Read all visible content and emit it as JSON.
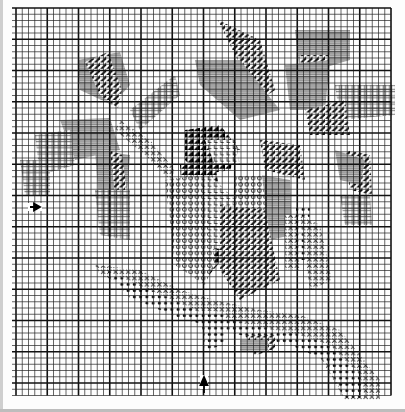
{
  "title": "Cross-stitch chart: bird on branch",
  "grid": {
    "left": 16,
    "top": 8,
    "cell": 6.25,
    "cols": 60,
    "rows": 62,
    "bold_every": 5,
    "line_color": "#222222",
    "bold_color": "#111111"
  },
  "center_markers": [
    {
      "name": "row-center-arrow",
      "direction": "right",
      "x": 30,
      "y": 207
    },
    {
      "name": "col-center-arrow",
      "direction": "up",
      "x": 204,
      "y": 385
    }
  ],
  "symbols": [
    {
      "key": "dark-diagonal",
      "meaning": "dark stitch (black diagonal)"
    },
    {
      "key": "grey-hatch",
      "meaning": "mid grey stitch"
    },
    {
      "key": "cross-hatch",
      "meaning": "light green cross-hatch"
    },
    {
      "key": "x-mark",
      "meaning": "branch light (x)"
    },
    {
      "key": "dot-circle",
      "meaning": "branch dark (dot)"
    },
    {
      "key": "L-mark",
      "meaning": "bird breast (L)"
    },
    {
      "key": "o-mark",
      "meaning": "bird belly (o)"
    },
    {
      "key": "solid-black",
      "meaning": "bird head/wing black"
    }
  ],
  "regions": [
    {
      "sym": "grey-hatch",
      "pts": "78,60 120,52 130,85 112,105 80,90"
    },
    {
      "sym": "dark-diagonal",
      "pts": "85,62 108,52 122,90 118,108 100,95"
    },
    {
      "sym": "cross-hatch",
      "pts": "130,110 175,75 180,95 140,130"
    },
    {
      "sym": "grey-hatch",
      "pts": "60,120 110,118 120,150 75,160"
    },
    {
      "sym": "cross-hatch",
      "pts": "35,135 70,130 75,165 40,175"
    },
    {
      "sym": "cross-hatch",
      "pts": "20,160 50,160 50,195 25,195"
    },
    {
      "sym": "grey-hatch",
      "pts": "95,150 130,155 125,225 100,215"
    },
    {
      "sym": "dark-diagonal",
      "pts": "110,150 122,155 128,200 115,195"
    },
    {
      "sym": "cross-hatch",
      "pts": "95,190 130,190 130,240 100,235"
    },
    {
      "sym": "dark-diagonal",
      "pts": "218,20 260,40 275,90 260,100 235,55"
    },
    {
      "sym": "grey-hatch",
      "pts": "195,60 240,60 280,110 240,120 200,85"
    },
    {
      "sym": "grey-hatch",
      "pts": "295,30 350,30 350,60 300,75"
    },
    {
      "sym": "dark-diagonal",
      "pts": "300,55 330,55 315,105 300,105"
    },
    {
      "sym": "grey-hatch",
      "pts": "285,65 330,60 325,110 290,110"
    },
    {
      "sym": "cross-hatch",
      "pts": "335,85 395,85 395,115 340,120"
    },
    {
      "sym": "dark-diagonal",
      "pts": "305,110 345,100 350,135 310,135"
    },
    {
      "sym": "dark-diagonal",
      "pts": "260,140 300,145 305,180 265,170"
    },
    {
      "sym": "dark-diagonal",
      "pts": "345,150 370,155 372,195 350,190"
    },
    {
      "sym": "grey-hatch",
      "pts": "335,150 365,160 360,185 340,180"
    },
    {
      "sym": "x-mark",
      "pts": "120,120 150,140 175,170 170,180 145,155 115,130"
    },
    {
      "sym": "solid-black",
      "pts": "185,130 220,125 240,150 230,170 200,175 185,160"
    },
    {
      "sym": "L-mark",
      "pts": "205,140 235,140 240,165 215,165"
    },
    {
      "sym": "solid-black",
      "pts": "180,165 215,165 230,250 205,280 185,250"
    },
    {
      "sym": "L-mark",
      "pts": "170,180 210,175 235,200 240,240 215,250 175,230"
    },
    {
      "sym": "o-mark",
      "pts": "165,180 200,175 215,260 205,285 175,265"
    },
    {
      "sym": "o-mark",
      "pts": "235,175 265,175 268,265 245,275 230,250"
    },
    {
      "sym": "grey-hatch",
      "pts": "262,175 290,180 292,235 270,240"
    },
    {
      "sym": "dark-diagonal",
      "pts": "220,205 265,210 280,280 240,300 220,270"
    },
    {
      "sym": "x-mark",
      "pts": "285,215 300,215 300,270 285,270"
    },
    {
      "sym": "dot-circle",
      "pts": "296,205 310,205 308,260 296,260"
    },
    {
      "sym": "x-mark",
      "pts": "300,215 320,225 332,280 310,290"
    },
    {
      "sym": "x-mark",
      "pts": "95,265 140,270 180,290 215,300 260,310 300,315 340,330 380,380 380,400 345,400 310,340 260,330 210,320 170,305 140,290 100,275"
    },
    {
      "sym": "dot-circle",
      "pts": "105,270 150,290 200,312 250,325 300,335 330,345 360,375 365,398 345,398 325,360 290,345 240,335 180,318 130,298"
    },
    {
      "sym": "dot-circle",
      "pts": "200,310 225,312 225,345 205,350"
    },
    {
      "sym": "dark-diagonal",
      "pts": "245,335 275,335 275,350 255,355"
    },
    {
      "sym": "grey-hatch",
      "pts": "240,340 268,340 268,352 240,352"
    },
    {
      "sym": "cross-hatch",
      "pts": "340,195 370,195 372,225 345,225"
    }
  ]
}
